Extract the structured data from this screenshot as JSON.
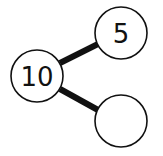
{
  "diagram": {
    "type": "number-bond",
    "whole": {
      "label": "10"
    },
    "parts": [
      {
        "label": "5"
      },
      {
        "label": ""
      }
    ],
    "colors": {
      "stroke": "#111111",
      "fill": "#ffffff",
      "background": "#ffffff"
    }
  }
}
